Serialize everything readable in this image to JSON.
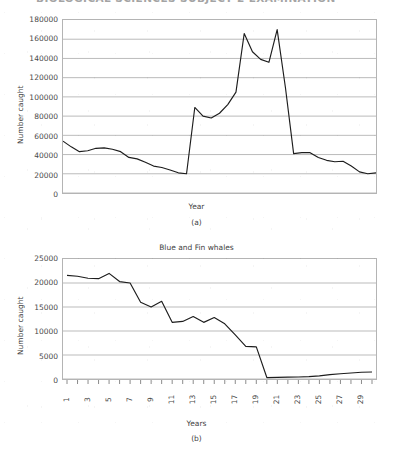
{
  "document": {
    "cropped_heading": "BIOLOGICAL SCIENCES SUBJECT 2 EXAMINATION"
  },
  "figures": [
    {
      "panel_letter": "(a)",
      "title": "",
      "ylabel": "Number caught",
      "xlabel": "Year"
    },
    {
      "panel_letter": "(b)",
      "title": "Blue and Fin whales",
      "ylabel": "Number caught",
      "xlabel": "Years"
    }
  ],
  "chart_data": [
    {
      "type": "line",
      "title": "",
      "xlabel": "Year",
      "ylabel": "Number caught",
      "ylim": [
        0,
        180000
      ],
      "yticks": [
        0,
        20000,
        40000,
        60000,
        80000,
        100000,
        120000,
        140000,
        160000,
        180000
      ],
      "xticks": [],
      "grid": true,
      "legend": "none",
      "series": [
        {
          "name": "Number caught",
          "x": [
            1,
            2,
            3,
            4,
            5,
            6,
            7,
            8,
            9,
            10,
            11,
            12,
            13,
            14,
            15,
            16,
            17,
            18,
            19,
            20,
            21,
            22,
            23,
            24,
            25,
            26,
            27,
            28,
            29,
            30
          ],
          "values": [
            54000,
            48000,
            43000,
            44000,
            46500,
            47000,
            45500,
            43000,
            37000,
            35500,
            32000,
            28000,
            26500,
            24000,
            21000,
            20000,
            89000,
            80000,
            78000,
            83000,
            92000,
            105000,
            166000,
            147000,
            139000,
            136000,
            170000,
            110000,
            41000,
            42000
          ],
          "values_tail": [
            42000,
            37000,
            34000,
            32500,
            33000,
            28000,
            22000,
            20000,
            21000
          ]
        }
      ]
    },
    {
      "type": "line",
      "title": "Blue and Fin whales",
      "xlabel": "Years",
      "ylabel": "Number caught",
      "ylim": [
        0,
        25000
      ],
      "yticks": [
        0,
        5000,
        10000,
        15000,
        20000,
        25000
      ],
      "xticks": [
        1,
        3,
        5,
        7,
        9,
        11,
        13,
        15,
        17,
        19,
        21,
        23,
        25,
        27,
        29
      ],
      "grid": true,
      "legend": "none",
      "series": [
        {
          "name": "Blue and Fin whales",
          "x": [
            1,
            2,
            3,
            4,
            5,
            6,
            7,
            8,
            9,
            10,
            11,
            12,
            13,
            14,
            15,
            16,
            17,
            18,
            19,
            20,
            21,
            22,
            23,
            24,
            25,
            26,
            27,
            28,
            29,
            30
          ],
          "values": [
            21600,
            21400,
            21000,
            20900,
            22000,
            20300,
            20000,
            16000,
            15000,
            16200,
            11800,
            12000,
            13000,
            11800,
            12800,
            11500,
            9200,
            6800,
            6700,
            300,
            350,
            400,
            420,
            500,
            650,
            900,
            1100,
            1250,
            1400,
            1450
          ]
        }
      ]
    }
  ]
}
